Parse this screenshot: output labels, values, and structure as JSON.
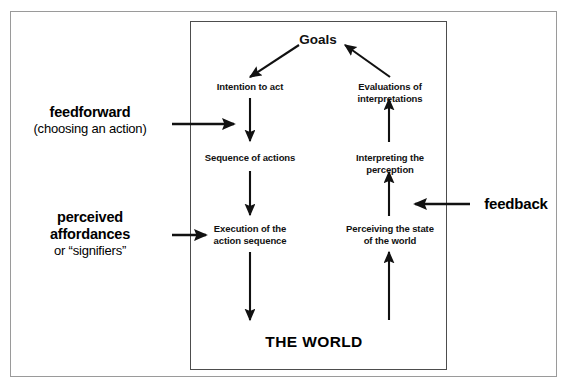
{
  "diagram": {
    "title_label": "THE WORLD",
    "container_name": "the-world",
    "nodes": {
      "goals": "Goals",
      "intention_to_act": "Intention to act",
      "sequence_of_actions": "Sequence of actions",
      "execution": "Execution of the\naction sequence",
      "evaluations": "Evaluations of\ninterpretations",
      "interpreting": "Interpreting the\nperception",
      "perceiving": "Perceiving the state\nof the world"
    },
    "annotations": {
      "feedforward_title": "feedforward",
      "feedforward_subtitle": "(choosing an action)",
      "affordances_title": "perceived\naffordances",
      "affordances_subtitle": "or “signifiers”",
      "feedback_title": "feedback"
    },
    "colors": {
      "ink": "#000000",
      "arrow": "#111111",
      "inner_border": "#4d4d4d",
      "outer_border": "#9a9a9a",
      "background": "#ffffff"
    }
  }
}
